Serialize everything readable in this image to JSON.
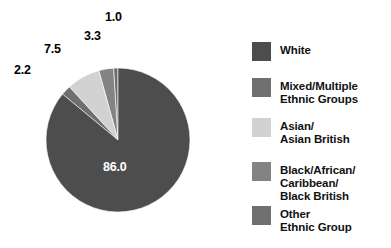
{
  "chart_data": {
    "type": "pie",
    "title": "",
    "subtitle": "",
    "xlabel": "",
    "ylabel": "",
    "grid": false,
    "legend_position": "right",
    "units": "percent",
    "start_angle_deg": 90,
    "direction": "counterclockwise",
    "categories": [
      "White",
      "Mixed/Multiple\nEthnic Groups",
      "Asian/\nAsian British",
      "Black/African/\nCaribbean/\nBlack British",
      "Other\nEthnic Group"
    ],
    "values": [
      86.0,
      2.2,
      7.5,
      3.3,
      1.0
    ],
    "labels": [
      "86.0",
      "2.2",
      "7.5",
      "3.3",
      "1.0"
    ],
    "colors": [
      "#4d4d4d",
      "#6f6f6f",
      "#d2d2d2",
      "#838383",
      "#6f6f6f"
    ],
    "exploded": [
      false,
      false,
      false,
      false,
      true
    ],
    "slices": [
      {
        "name": "White",
        "value": 86.0,
        "label": "86.0",
        "color": "#4d4d4d",
        "label_color": "#ffffff",
        "label_inside": true,
        "label_x": 103,
        "label_y": 160
      },
      {
        "name": "Mixed/Multiple Ethnic Groups",
        "value": 2.2,
        "label": "2.2",
        "color": "#6f6f6f",
        "label_color": "#000000",
        "label_inside": false,
        "label_x": 14,
        "label_y": 63
      },
      {
        "name": "Asian/Asian British",
        "value": 7.5,
        "label": "7.5",
        "color": "#d2d2d2",
        "label_color": "#000000",
        "label_inside": false,
        "label_x": 44,
        "label_y": 42
      },
      {
        "name": "Black/African/Caribbean/Black British",
        "value": 3.3,
        "label": "3.3",
        "color": "#838383",
        "label_color": "#000000",
        "label_inside": false,
        "label_x": 84,
        "label_y": 29
      },
      {
        "name": "Other Ethnic Group",
        "value": 1.0,
        "label": "1.0",
        "color": "#6f6f6f",
        "label_color": "#000000",
        "label_inside": false,
        "label_x": 105,
        "label_y": 10
      }
    ]
  },
  "legend": {
    "items": [
      {
        "label": "White",
        "color": "#4d4d4d"
      },
      {
        "label": "Mixed/Multiple\nEthnic Groups",
        "color": "#6f6f6f"
      },
      {
        "label": "Asian/\nAsian British",
        "color": "#d2d2d2"
      },
      {
        "label": "Black/African/\nCaribbean/\nBlack British",
        "color": "#838383"
      },
      {
        "label": "Other\nEthnic Group",
        "color": "#6f6f6f"
      }
    ]
  },
  "colors": {
    "background": "#ffffff",
    "text": "#111111",
    "label_on_dark": "#ffffff"
  }
}
